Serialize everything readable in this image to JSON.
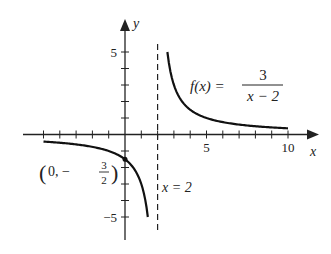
{
  "chart_data": {
    "type": "line",
    "title": "",
    "xlabel": "x",
    "ylabel": "y",
    "xlim": [
      -6,
      11.5
    ],
    "ylim": [
      -6,
      7
    ],
    "grid": false,
    "x_tick_labels": [
      "5",
      "10"
    ],
    "y_tick_labels": [
      "5",
      "−5"
    ],
    "function_label": {
      "lhs": "f(x) =",
      "numerator": "3",
      "denominator": "x − 2"
    },
    "asymptote": {
      "type": "vertical",
      "x": 2,
      "label": "x = 2",
      "style": "dashed"
    },
    "point": {
      "x": 0,
      "y": -1.5,
      "label_open": "(0, −",
      "label_num": "3",
      "label_den": "2",
      "label_close": ")"
    },
    "series": [
      {
        "name": "left branch",
        "x": [
          -5,
          -4,
          -3,
          -2,
          -1,
          0,
          0.5,
          1,
          1.4
        ],
        "y": [
          -0.43,
          -0.5,
          -0.6,
          -0.75,
          -1,
          -1.5,
          -2,
          -3,
          -5
        ]
      },
      {
        "name": "right branch",
        "x": [
          2.6,
          3,
          3.5,
          4,
          5,
          6,
          7,
          8,
          9,
          10
        ],
        "y": [
          5,
          3,
          2,
          1.5,
          1,
          0.75,
          0.6,
          0.5,
          0.43,
          0.375
        ]
      }
    ]
  }
}
